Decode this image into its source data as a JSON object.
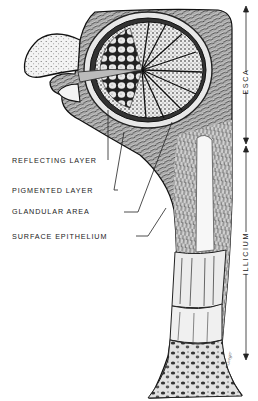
{
  "figure": {
    "labels": {
      "reflecting_layer": "REFLECTING LAYER",
      "pigmented_layer": "PIGMENTED LAYER",
      "glandular_area": "GLANDULAR AREA",
      "surface_epithelium": "SURFACE EPITHELIUM"
    },
    "regions": {
      "esca": "ESCA",
      "illicium": "ILLICIUM"
    },
    "signature": "Greger"
  }
}
